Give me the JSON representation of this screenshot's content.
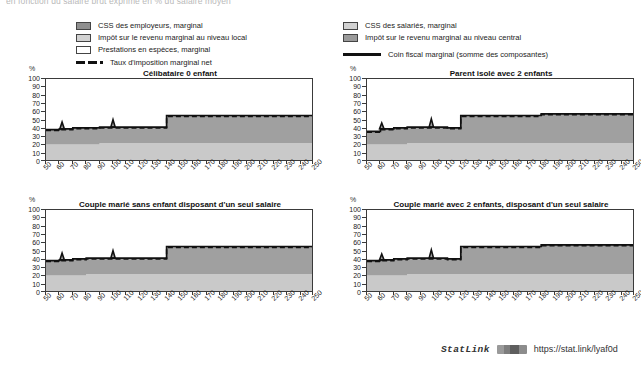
{
  "figure": {
    "subtitle": "en fonction du salaire brut exprimé en % du salaire moyen"
  },
  "legend": {
    "left": [
      {
        "label": "CSS des employeurs, marginal",
        "swatch": "swatch-employer-ssc",
        "color": "#8f8f8f"
      },
      {
        "label": "Impôt sur le revenu marginal au niveau local",
        "swatch": "swatch-local-income-tax",
        "color": "#d2d2d2"
      },
      {
        "label": "Prestations en espèces, marginal",
        "swatch": "swatch-cash-benefits",
        "color": "#ffffff"
      },
      {
        "label": "Taux d'imposition marginal net",
        "swatch": "dashed-line-key",
        "color": "#111111"
      }
    ],
    "right": [
      {
        "label": "CSS des salariés, marginal",
        "swatch": "swatch-employee-ssc",
        "color": "#d2d2d2"
      },
      {
        "label": "Impôt sur le revenu marginal au niveau central",
        "swatch": "swatch-central-income-tax",
        "color": "#9a9a9a"
      },
      {
        "label": "Coin fiscal marginal (somme des composantes)",
        "swatch": "solid-line-key",
        "color": "#111111"
      }
    ]
  },
  "statlink": {
    "word": "StatLink",
    "url": "https://stat.link/lyaf0d"
  },
  "chart_data": [
    {
      "id": "celibataire-0-enfant",
      "type": "area",
      "title": "Célibataire 0 enfant",
      "ylabel": "%",
      "xlabel": "",
      "ylim": [
        0,
        100
      ],
      "yticks": [
        0,
        10,
        20,
        30,
        40,
        50,
        60,
        70,
        80,
        90,
        100
      ],
      "x": [
        50,
        60,
        70,
        80,
        90,
        100,
        110,
        120,
        130,
        140,
        150,
        160,
        170,
        180,
        190,
        200,
        210,
        220,
        230,
        240,
        250
      ],
      "xlim": [
        50,
        250
      ],
      "grid": false,
      "series": [
        {
          "name": "Impôt sur le revenu marginal au niveau local",
          "values": [
            21,
            21,
            21,
            21,
            23,
            23,
            23,
            23,
            23,
            23,
            23,
            23,
            23,
            23,
            23,
            23,
            23,
            23,
            23,
            23,
            23
          ]
        },
        {
          "name": "Impôt sur le revenu marginal au niveau central",
          "values": [
            18,
            19,
            20,
            19,
            19,
            19,
            19,
            19,
            19,
            33,
            33,
            33,
            33,
            33,
            33,
            33,
            33,
            33,
            33,
            33,
            33
          ]
        }
      ],
      "marginal_tax_rate_line": {
        "name": "Taux d'imposition marginal net",
        "values": [
          39,
          40,
          41,
          41,
          42,
          42,
          42,
          42,
          42,
          56,
          56,
          56,
          56,
          56,
          56,
          56,
          56,
          56,
          56,
          56,
          56
        ]
      },
      "tax_wedge_line": {
        "name": "Coin fiscal marginal (somme des composantes)",
        "values": [
          39,
          40,
          41,
          41,
          42,
          42,
          42,
          42,
          42,
          56,
          56,
          56,
          56,
          56,
          56,
          56,
          56,
          56,
          56,
          56,
          56
        ]
      },
      "spikes": [
        {
          "x": 62,
          "y": 48
        },
        {
          "x": 100,
          "y": 51
        }
      ]
    },
    {
      "id": "parent-isole-2-enfants",
      "type": "area",
      "title": "Parent isolé avec 2 enfants",
      "ylabel": "%",
      "xlabel": "",
      "ylim": [
        0,
        100
      ],
      "yticks": [
        0,
        10,
        20,
        30,
        40,
        50,
        60,
        70,
        80,
        90,
        100
      ],
      "x": [
        50,
        60,
        70,
        80,
        90,
        100,
        110,
        120,
        130,
        140,
        150,
        160,
        170,
        180,
        190,
        200,
        210,
        220,
        230,
        240,
        250
      ],
      "xlim": [
        50,
        250
      ],
      "grid": false,
      "series": [
        {
          "name": "Impôt sur le revenu marginal au niveau local",
          "values": [
            21,
            21,
            21,
            23,
            23,
            23,
            23,
            23,
            23,
            23,
            23,
            23,
            23,
            23,
            23,
            23,
            23,
            23,
            23,
            23,
            23
          ]
        },
        {
          "name": "Impôt sur le revenu marginal au niveau central",
          "values": [
            16,
            19,
            20,
            19,
            19,
            19,
            19,
            33,
            33,
            33,
            33,
            33,
            33,
            35,
            35,
            35,
            35,
            35,
            35,
            35,
            35
          ]
        }
      ],
      "marginal_tax_rate_line": {
        "name": "Taux d'imposition marginal net",
        "values": [
          37,
          40,
          41,
          42,
          42,
          42,
          41,
          56,
          56,
          56,
          56,
          56,
          56,
          58,
          58,
          58,
          58,
          58,
          58,
          58,
          58
        ]
      },
      "tax_wedge_line": {
        "name": "Coin fiscal marginal (somme des composantes)",
        "values": [
          37,
          40,
          41,
          42,
          42,
          42,
          41,
          56,
          56,
          56,
          56,
          56,
          56,
          58,
          58,
          58,
          58,
          58,
          58,
          58,
          58
        ]
      },
      "spikes": [
        {
          "x": 61,
          "y": 47
        },
        {
          "x": 98,
          "y": 52
        }
      ]
    },
    {
      "id": "couple-marie-sans-enfant",
      "type": "area",
      "title": "Couple marié sans enfant disposant d'un seul salaire",
      "ylabel": "%",
      "xlabel": "",
      "ylim": [
        0,
        100
      ],
      "yticks": [
        0,
        10,
        20,
        30,
        40,
        50,
        60,
        70,
        80,
        90,
        100
      ],
      "x": [
        50,
        60,
        70,
        80,
        90,
        100,
        110,
        120,
        130,
        140,
        150,
        160,
        170,
        180,
        190,
        200,
        210,
        220,
        230,
        240,
        250
      ],
      "xlim": [
        50,
        250
      ],
      "grid": false,
      "series": [
        {
          "name": "Impôt sur le revenu marginal au niveau local",
          "values": [
            21,
            21,
            21,
            23,
            23,
            23,
            23,
            23,
            23,
            23,
            23,
            23,
            23,
            23,
            23,
            23,
            23,
            23,
            23,
            23,
            23
          ]
        },
        {
          "name": "Impôt sur le revenu marginal au niveau central",
          "values": [
            18,
            19,
            20,
            19,
            19,
            19,
            19,
            19,
            19,
            33,
            33,
            33,
            33,
            33,
            33,
            33,
            33,
            33,
            33,
            33,
            33
          ]
        }
      ],
      "marginal_tax_rate_line": {
        "name": "Taux d'imposition marginal net",
        "values": [
          39,
          40,
          41,
          42,
          42,
          42,
          42,
          42,
          42,
          56,
          56,
          56,
          56,
          56,
          56,
          56,
          56,
          56,
          56,
          56,
          56
        ]
      },
      "tax_wedge_line": {
        "name": "Coin fiscal marginal (somme des composantes)",
        "values": [
          39,
          40,
          41,
          42,
          42,
          42,
          42,
          42,
          42,
          56,
          56,
          56,
          56,
          56,
          56,
          56,
          56,
          56,
          56,
          56,
          56
        ]
      },
      "spikes": [
        {
          "x": 62,
          "y": 48
        },
        {
          "x": 100,
          "y": 51
        }
      ]
    },
    {
      "id": "couple-marie-2-enfants",
      "type": "area",
      "title": "Couple marié avec 2 enfants, disposant d'un seul salaire",
      "ylabel": "%",
      "xlabel": "",
      "ylim": [
        0,
        100
      ],
      "yticks": [
        0,
        10,
        20,
        30,
        40,
        50,
        60,
        70,
        80,
        90,
        100
      ],
      "x": [
        50,
        60,
        70,
        80,
        90,
        100,
        110,
        120,
        130,
        140,
        150,
        160,
        170,
        180,
        190,
        200,
        210,
        220,
        230,
        240,
        250
      ],
      "xlim": [
        50,
        250
      ],
      "grid": false,
      "series": [
        {
          "name": "Impôt sur le revenu marginal au niveau local",
          "values": [
            21,
            21,
            21,
            23,
            23,
            23,
            23,
            23,
            23,
            23,
            23,
            23,
            23,
            23,
            23,
            23,
            23,
            23,
            23,
            23,
            23
          ]
        },
        {
          "name": "Impôt sur le revenu marginal au niveau central",
          "values": [
            18,
            19,
            20,
            19,
            19,
            19,
            19,
            33,
            33,
            33,
            33,
            33,
            33,
            35,
            35,
            35,
            35,
            35,
            35,
            35,
            35
          ]
        }
      ],
      "marginal_tax_rate_line": {
        "name": "Taux d'imposition marginal net",
        "values": [
          39,
          40,
          41,
          42,
          42,
          42,
          41,
          56,
          56,
          56,
          56,
          56,
          56,
          58,
          58,
          58,
          58,
          58,
          58,
          58,
          58
        ]
      },
      "tax_wedge_line": {
        "name": "Coin fiscal marginal (somme des composantes)",
        "values": [
          39,
          40,
          41,
          42,
          42,
          42,
          41,
          56,
          56,
          56,
          56,
          56,
          56,
          58,
          58,
          58,
          58,
          58,
          58,
          58,
          58
        ]
      },
      "spikes": [
        {
          "x": 61,
          "y": 47
        },
        {
          "x": 98,
          "y": 52
        }
      ]
    }
  ]
}
